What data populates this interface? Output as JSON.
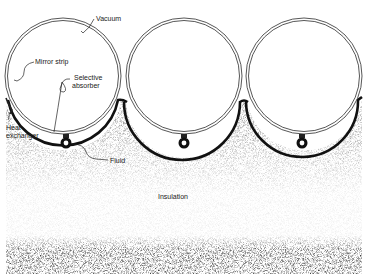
{
  "diagram": {
    "type": "cross-section",
    "labels": {
      "vacuum": "Vacuum",
      "mirror_strip": "Mirror strip",
      "selective_absorber_line1": "Selective",
      "selective_absorber_line2": "absorber",
      "heat_exchanger_line1": "Heat",
      "heat_exchanger_line2": "exchanger",
      "fluid": "Fluid",
      "insulation": "Insulation"
    },
    "tubes_count": 3,
    "colors": {
      "outline": "#333333",
      "absorber": "#111111",
      "insulation_speckle": "#555555",
      "background": "#ffffff"
    }
  }
}
